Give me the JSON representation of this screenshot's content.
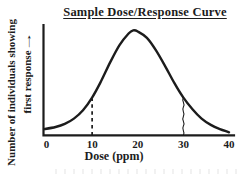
{
  "figure": {
    "title": "Sample Dose/Response Curve",
    "y_axis_label": {
      "line1": "Number of individuals showing",
      "line2": "first response",
      "arrow": "→"
    },
    "x_axis_label": "Dose (ppm)"
  },
  "chart_data": {
    "type": "line",
    "title": "Sample Dose/Response Curve",
    "xlabel": "Dose (ppm)",
    "ylabel": "Number of individuals showing first response",
    "xlim": [
      0,
      40
    ],
    "x_ticks": [
      0,
      10,
      20,
      30,
      40
    ],
    "y_ticks": [],
    "grid": false,
    "legend": "none",
    "curve_shape": "bell-shaped normal distribution, peak near 19 ppm",
    "x": [
      0,
      2,
      4,
      6,
      8,
      10,
      12,
      14,
      16,
      18,
      19,
      20,
      22,
      24,
      26,
      28,
      30,
      32,
      34,
      36,
      38,
      40
    ],
    "y": [
      6,
      8,
      11,
      16,
      24,
      36,
      52,
      70,
      86,
      97,
      100,
      99,
      93,
      81,
      66,
      50,
      36,
      25,
      16,
      10,
      6,
      3
    ],
    "annotations": [
      {
        "type": "vline",
        "x": 10,
        "style": "dashed",
        "note": "vertical dashed line from axis up to curve at 10 ppm"
      },
      {
        "type": "vline",
        "x": 30,
        "style": "wavy",
        "note": "vertical wavy line from axis up to curve at 30 ppm"
      }
    ]
  },
  "colors": {
    "ink": "#1c1c1c",
    "background": "#ffffff"
  }
}
